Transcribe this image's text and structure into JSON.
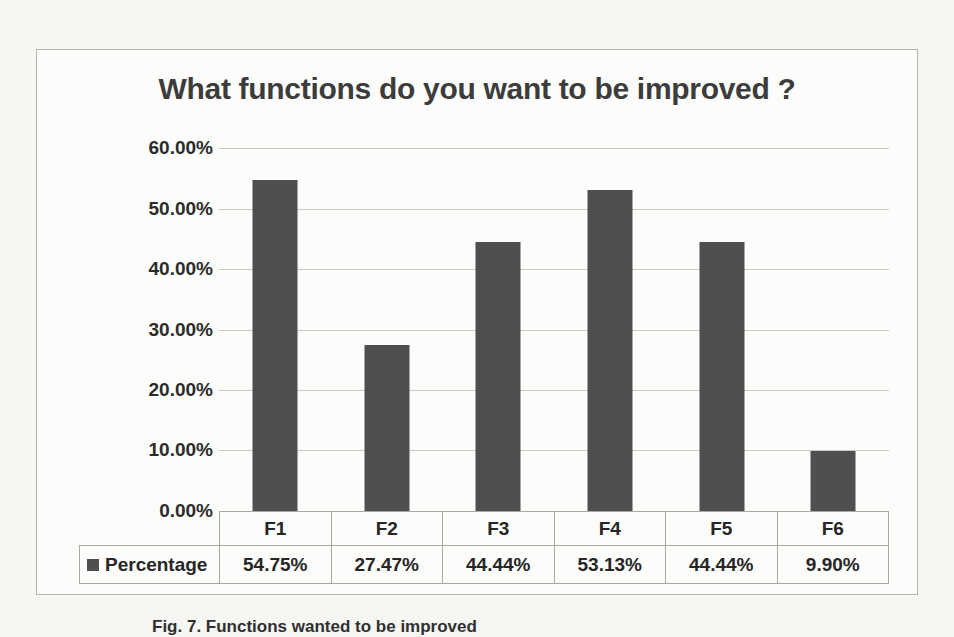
{
  "figure": {
    "caption": "Fig. 7. Functions wanted to be improved"
  },
  "chart_data": {
    "type": "bar",
    "title": "What functions do you want to be improved ?",
    "categories": [
      "F1",
      "F2",
      "F3",
      "F4",
      "F5",
      "F6"
    ],
    "series": [
      {
        "name": "Percentage",
        "values": [
          54.75,
          27.47,
          44.44,
          53.13,
          44.44,
          9.9
        ],
        "display_values": [
          "54.75%",
          "27.47%",
          "44.44%",
          "53.13%",
          "44.44%",
          "9.90%"
        ],
        "color": "#4f4f4f"
      }
    ],
    "xlabel": "",
    "ylabel": "",
    "ylim": [
      0,
      60
    ],
    "ytick_labels": [
      "60.00%",
      "50.00%",
      "40.00%",
      "30.00%",
      "20.00%",
      "10.00%",
      "0.00%"
    ],
    "grid": true,
    "legend_position": "data-table-left",
    "data_table_shown": true
  },
  "colors": {
    "bar": "#4f4f4f",
    "gridline": "#c9c9c6",
    "table_border": "#a8a8a5",
    "frame_border": "#b3b3b0",
    "paper_background": "#f6f6f3"
  }
}
